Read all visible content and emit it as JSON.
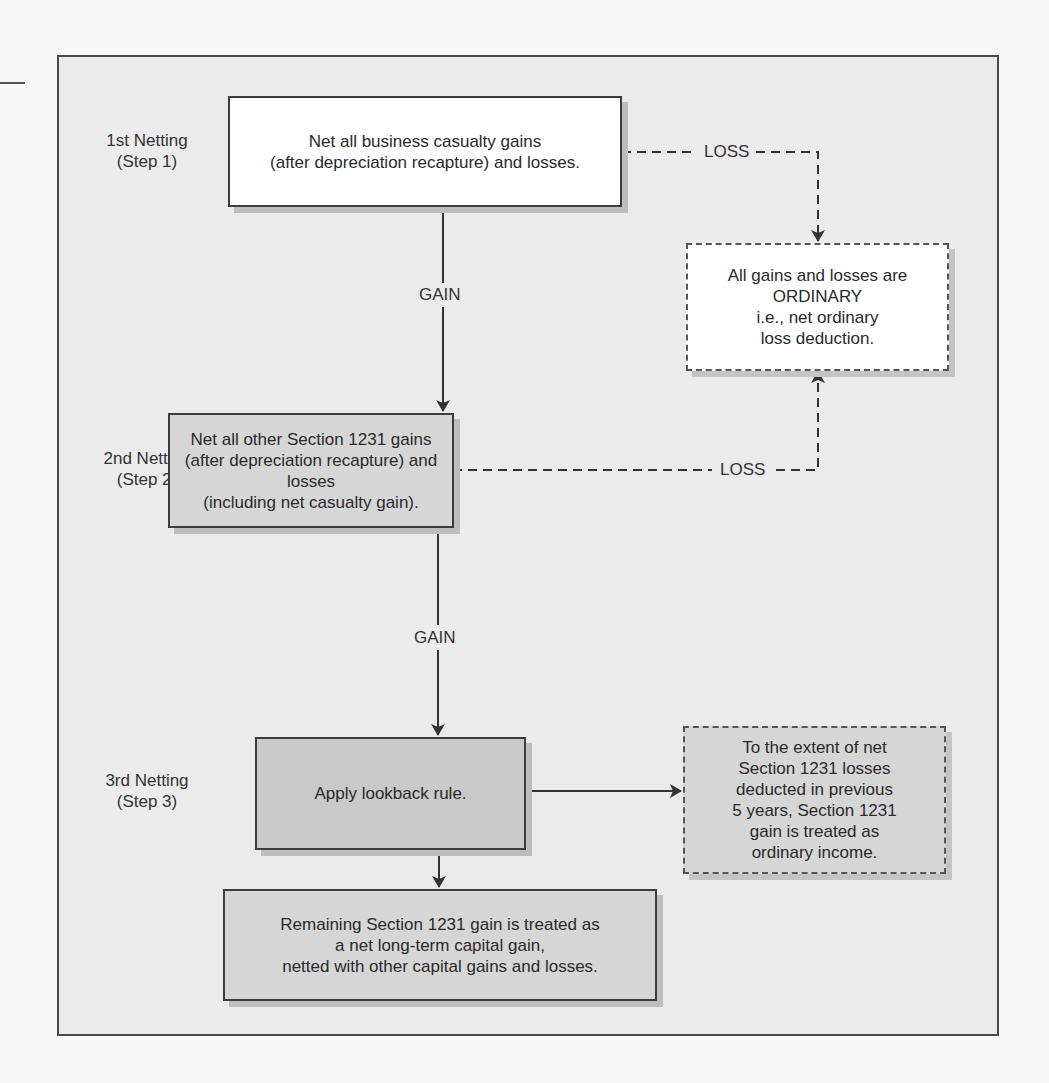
{
  "diagram": {
    "type": "flowchart",
    "steps": [
      {
        "label_line1": "1st Netting",
        "label_line2": "(Step 1)"
      },
      {
        "label_line1": "2nd Netting",
        "label_line2": "(Step 2)"
      },
      {
        "label_line1": "3rd Netting",
        "label_line2": "(Step 3)"
      }
    ],
    "boxes": {
      "step1": "Net all business casualty gains\n(after depreciation recapture) and losses.",
      "ordinary": "All gains and losses are\nORDINARY\ni.e., net ordinary\nloss deduction.",
      "step2": "Net all other Section 1231 gains\n(after depreciation recapture) and losses\n(including net casualty gain).",
      "step3": "Apply lookback rule.",
      "lookback_result": "To the extent of net\nSection 1231 losses\ndeducted in previous\n5 years, Section 1231\ngain is treated as\nordinary income.",
      "final": "Remaining Section 1231 gain is treated as\na net long-term capital gain,\nnetted with other capital gains and losses."
    },
    "edges": {
      "step1_gain": "GAIN",
      "step1_loss": "LOSS",
      "step2_gain": "GAIN",
      "step2_loss": "LOSS"
    },
    "colors": {
      "frame_bg": "#ebebeb",
      "box_white": "#ffffff",
      "box_gray_light": "#d6d6d6",
      "box_gray_dark": "#c9c9c9",
      "line": "#3c3c3c"
    }
  }
}
